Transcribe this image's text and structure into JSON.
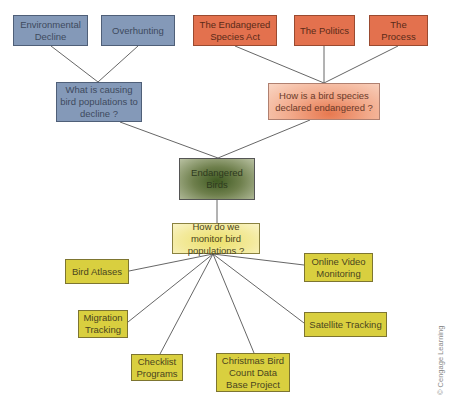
{
  "diagram": {
    "center": {
      "label": "Endangered Birds"
    },
    "branches": {
      "causes": {
        "question": "What is causing bird populations to decline ?",
        "children": [
          "Environmental Decline",
          "Overhunting"
        ]
      },
      "declared": {
        "question": "How is a bird species declared endangered ?",
        "children": [
          "The Endangered Species Act",
          "The Politics",
          "The Process"
        ]
      },
      "monitor": {
        "question": "How do we monitor bird populations ?",
        "children": [
          "Bird Atlases",
          "Migration Tracking",
          "Checklist Programs",
          "Christmas Bird Count Data Base Project",
          "Satellite Tracking",
          "Online Video Monitoring"
        ]
      }
    },
    "colors": {
      "causes": "#8499b8",
      "declared_children": "#e3714e",
      "declared_question": "#f2a98a",
      "center": "#5b6e38",
      "monitor_question": "#f3ea9c",
      "monitor_children": "#d9cf3f"
    }
  },
  "copyright": "© Cengage Learning"
}
